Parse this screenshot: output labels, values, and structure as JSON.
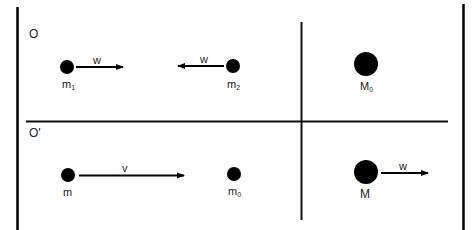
{
  "frames": {
    "top": {
      "label": "O"
    },
    "bottom": {
      "label": "O′"
    }
  },
  "top_row": {
    "particle_1": {
      "label": "m",
      "subscript": "1",
      "velocity_label": "w",
      "direction": "right"
    },
    "particle_2": {
      "label": "m",
      "subscript": "2",
      "velocity_label": "w",
      "direction": "left"
    },
    "product": {
      "label": "M",
      "subscript": "0"
    }
  },
  "bottom_row": {
    "particle_1": {
      "label": "m",
      "subscript": "",
      "velocity_label": "v",
      "direction": "right"
    },
    "particle_2": {
      "label": "m",
      "subscript": "0"
    },
    "product": {
      "label": "M",
      "subscript": "",
      "velocity_label": "w",
      "direction": "right"
    }
  },
  "colors": {
    "ink": "#000000",
    "text": "#222222",
    "background": "#ffffff"
  }
}
